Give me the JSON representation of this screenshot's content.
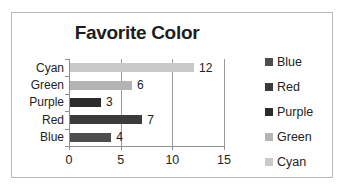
{
  "chart_data": {
    "type": "bar",
    "orientation": "horizontal",
    "title": "Favorite Color",
    "xlabel": "",
    "ylabel": "",
    "categories": [
      "Cyan",
      "Green",
      "Purple",
      "Red",
      "Blue"
    ],
    "values": [
      12,
      6,
      3,
      7,
      4
    ],
    "data_labels": [
      "12",
      "6",
      "3",
      "7",
      "4"
    ],
    "bar_colors": [
      "#c9c9c9",
      "#b4b4b4",
      "#2b2b2b",
      "#3b3b3b",
      "#4d4d4d"
    ],
    "xlim": [
      0,
      15
    ],
    "xticks": [
      0,
      5,
      10,
      15
    ],
    "xtick_labels": [
      "0",
      "5",
      "10",
      "15"
    ],
    "grid": "vertical",
    "legend_position": "right",
    "legend": [
      {
        "label": "Blue",
        "color": "#4d4d4d"
      },
      {
        "label": "Red",
        "color": "#3b3b3b"
      },
      {
        "label": "Purple",
        "color": "#2b2b2b"
      },
      {
        "label": "Green",
        "color": "#b4b4b4"
      },
      {
        "label": "Cyan",
        "color": "#c9c9c9"
      }
    ]
  },
  "style": {
    "frame_border_color": "#b9b9b9",
    "axis_color": "#8f8f8f",
    "gridline_color": "#9b9b9b",
    "text_color": "#232323",
    "title_color": "#1d1d1d",
    "background": "#ffffff"
  }
}
